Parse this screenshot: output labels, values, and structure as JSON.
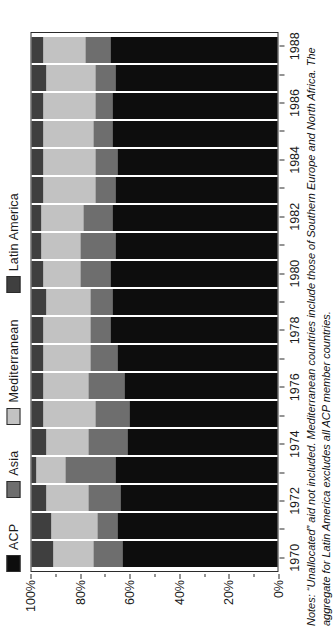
{
  "chart_data": {
    "type": "bar",
    "subtype": "stacked-percentage",
    "title": "",
    "xlabel": "",
    "ylabel": "",
    "ylim": [
      0,
      100
    ],
    "grid": false,
    "orientation": "vertical",
    "legend_position": "top-left",
    "categories": [
      "1970",
      "1971",
      "1972",
      "1973",
      "1974",
      "1975",
      "1976",
      "1977",
      "1978",
      "1979",
      "1980",
      "1981",
      "1982",
      "1983",
      "1984",
      "1985",
      "1986",
      "1987",
      "1988"
    ],
    "x_tick_labels": [
      "1970",
      "1972",
      "1974",
      "1976",
      "1978",
      "1980",
      "1982",
      "1984",
      "1986",
      "1988"
    ],
    "y_tick_labels": [
      "0%",
      "20%",
      "40%",
      "60%",
      "80%",
      "100%"
    ],
    "y_tick_values": [
      0,
      20,
      40,
      60,
      80,
      100
    ],
    "series": [
      {
        "name": "ACP",
        "color": "#0d0d0d",
        "values": [
          63,
          65,
          64,
          66,
          61,
          60,
          62,
          65,
          68,
          67,
          68,
          66,
          67,
          66,
          65,
          67,
          67,
          66,
          68
        ]
      },
      {
        "name": "Asia",
        "color": "#6e6e6e",
        "values": [
          12,
          8,
          13,
          20,
          16,
          14,
          15,
          11,
          8,
          9,
          12,
          14,
          12,
          8,
          9,
          8,
          7,
          8,
          10
        ]
      },
      {
        "name": "Mediterranean",
        "color": "#c2c2c2",
        "values": [
          16,
          19,
          17,
          12,
          17,
          21,
          18,
          19,
          19,
          18,
          15,
          16,
          17,
          21,
          21,
          20,
          21,
          20,
          17
        ]
      },
      {
        "name": "Latin America",
        "color": "#3f3f3f",
        "values": [
          9,
          8,
          6,
          2,
          6,
          5,
          5,
          5,
          5,
          6,
          5,
          4,
          4,
          5,
          5,
          5,
          5,
          6,
          5
        ]
      }
    ]
  },
  "legend": {
    "items": [
      {
        "label": "ACP",
        "color": "#0d0d0d"
      },
      {
        "label": "Asia",
        "color": "#6e6e6e"
      },
      {
        "label": "Mediterranean",
        "color": "#c2c2c2"
      },
      {
        "label": "Latin America",
        "color": "#3f3f3f"
      }
    ]
  },
  "notes": {
    "lead": "Notes:",
    "text": " “Unallocated” aid not included. Mediterranean countries include those of Southern Europe and North Africa. The aggregate for Latin America excludes all ACP member countries."
  }
}
